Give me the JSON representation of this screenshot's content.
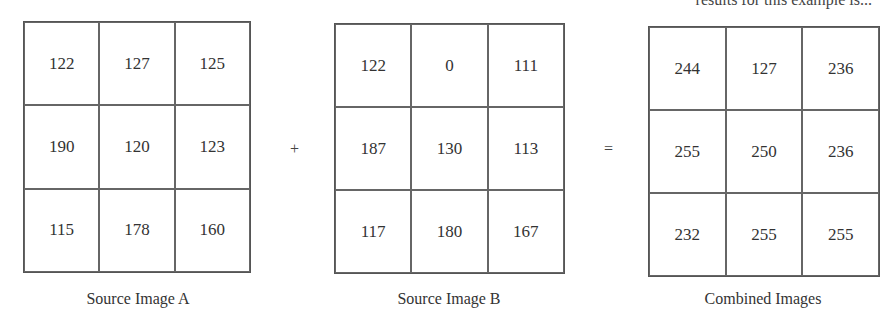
{
  "header": {
    "fragment_text": "results for this example is..."
  },
  "operators": {
    "plus": "+",
    "equals": "="
  },
  "grids": {
    "a": {
      "caption": "Source Image A",
      "cells": [
        "122",
        "127",
        "125",
        "190",
        "120",
        "123",
        "115",
        "178",
        "160"
      ]
    },
    "b": {
      "caption": "Source Image B",
      "cells": [
        "122",
        "0",
        "111",
        "187",
        "130",
        "113",
        "117",
        "180",
        "167"
      ]
    },
    "c": {
      "caption": "Combined Images",
      "cells": [
        "244",
        "127",
        "236",
        "255",
        "250",
        "236",
        "232",
        "255",
        "255"
      ]
    }
  }
}
